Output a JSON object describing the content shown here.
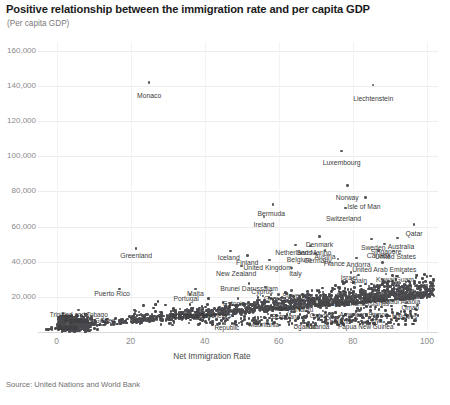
{
  "header": {
    "title": "Positive relationship between the immigration rate and per capita GDP",
    "subtitle": "(Per capita GDP)"
  },
  "footer": {
    "source": "Source: United Nations and World Bank"
  },
  "chart_data": {
    "type": "scatter",
    "title": "Positive relationship between the immigration rate and per capita GDP",
    "subtitle": "(Per capita GDP)",
    "xlabel": "Net Immigration Rate",
    "ylabel": "(Per capita GDP)",
    "xlim": [
      -5,
      103
    ],
    "ylim": [
      0,
      165000
    ],
    "xticks": [
      0,
      20,
      40,
      60,
      80,
      100
    ],
    "xtick_labels": [
      "0",
      "20",
      "40",
      "60",
      "80",
      "100"
    ],
    "yticks": [
      20000,
      40000,
      60000,
      80000,
      100000,
      120000,
      140000,
      160000
    ],
    "ytick_labels": [
      "20,000",
      "40,000",
      "60,000",
      "80,000",
      "100,000",
      "120,000",
      "140,000",
      "160,000"
    ],
    "grid": true,
    "legend": "none",
    "marker_color": "#58585c",
    "source": "Source: United Nations and World Bank",
    "labeled_points": [
      {
        "name": "Monaco",
        "x": 25.0,
        "y": 142000,
        "lx": 25.0,
        "ly": 134000
      },
      {
        "name": "Liechtenstein",
        "x": 85.5,
        "y": 140500,
        "lx": 85.5,
        "ly": 132500
      },
      {
        "name": "Luxembourg",
        "x": 77.0,
        "y": 103000,
        "lx": 77.0,
        "ly": 96000
      },
      {
        "name": "Norway",
        "x": 78.5,
        "y": 83500,
        "lx": 78.5,
        "ly": 76500
      },
      {
        "name": "Isle of Man",
        "x": 83.5,
        "y": 76500,
        "lx": 83.0,
        "ly": 71000
      },
      {
        "name": "Switzerland",
        "x": 78.0,
        "y": 70500,
        "lx": 77.5,
        "ly": 64500
      },
      {
        "name": "Bermuda",
        "x": 58.5,
        "y": 72500,
        "lx": 58.0,
        "ly": 67000
      },
      {
        "name": "Ireland",
        "x": 56.0,
        "y": 65500,
        "lx": 56.0,
        "ly": 61000
      },
      {
        "name": "Qatar",
        "x": 96.5,
        "y": 61000,
        "lx": 96.5,
        "ly": 55500
      },
      {
        "name": "Denmark",
        "x": 71.0,
        "y": 54500,
        "lx": 71.0,
        "ly": 49500
      },
      {
        "name": "Sweden",
        "x": 85.0,
        "y": 53000,
        "lx": 85.5,
        "ly": 48000
      },
      {
        "name": "Australia",
        "x": 92.0,
        "y": 53500,
        "lx": 93.0,
        "ly": 48500
      },
      {
        "name": "Singapore",
        "x": 88.5,
        "y": 50000,
        "lx": 89.0,
        "ly": 45500
      },
      {
        "name": "Canada",
        "x": 87.0,
        "y": 46500,
        "lx": 87.0,
        "ly": 43000
      },
      {
        "name": "United States",
        "x": 91.0,
        "y": 46000,
        "lx": 91.5,
        "ly": 42500
      },
      {
        "name": "Netherlands",
        "x": 64.5,
        "y": 49500,
        "lx": 64.0,
        "ly": 45000
      },
      {
        "name": "San Marino",
        "x": 68.5,
        "y": 49000,
        "lx": 69.5,
        "ly": 45000
      },
      {
        "name": "Austria",
        "x": 72.5,
        "y": 46500,
        "lx": 72.5,
        "ly": 42500
      },
      {
        "name": "Belgium",
        "x": 66.0,
        "y": 45000,
        "lx": 65.5,
        "ly": 41000
      },
      {
        "name": "Germany",
        "x": 70.0,
        "y": 44500,
        "lx": 70.5,
        "ly": 40500
      },
      {
        "name": "Andorra",
        "x": 81.0,
        "y": 42000,
        "lx": 81.5,
        "ly": 38000
      },
      {
        "name": "France",
        "x": 76.0,
        "y": 41500,
        "lx": 75.0,
        "ly": 38500
      },
      {
        "name": "Iceland",
        "x": 47.0,
        "y": 46000,
        "lx": 46.5,
        "ly": 42000
      },
      {
        "name": "Finland",
        "x": 51.5,
        "y": 43500,
        "lx": 51.5,
        "ly": 39500
      },
      {
        "name": "United Kingdom",
        "x": 57.5,
        "y": 41000,
        "lx": 57.0,
        "ly": 36500
      },
      {
        "name": "New Zealand",
        "x": 50.0,
        "y": 37500,
        "lx": 48.5,
        "ly": 33000
      },
      {
        "name": "Italy",
        "x": 63.5,
        "y": 36500,
        "lx": 64.5,
        "ly": 33000
      },
      {
        "name": "Greenland",
        "x": 21.5,
        "y": 47500,
        "lx": 21.5,
        "ly": 43500
      },
      {
        "name": "United Arab Emirates",
        "x": 88.0,
        "y": 39500,
        "lx": 88.5,
        "ly": 35500
      },
      {
        "name": "Israel",
        "x": 79.5,
        "y": 34000,
        "lx": 79.0,
        "ly": 30500
      },
      {
        "name": "Spain",
        "x": 81.5,
        "y": 32500,
        "lx": 81.5,
        "ly": 29000
      },
      {
        "name": "Kuwait",
        "x": 89.0,
        "y": 33000,
        "lx": 89.0,
        "ly": 29500
      },
      {
        "name": "Guam",
        "x": 93.5,
        "y": 33500,
        "lx": 94.0,
        "ly": 29500
      },
      {
        "name": "Puerto Rico",
        "x": 17.0,
        "y": 24500,
        "lx": 15.0,
        "ly": 21500
      },
      {
        "name": "Malta",
        "x": 37.5,
        "y": 24500,
        "lx": 37.5,
        "ly": 21500
      },
      {
        "name": "Portugal",
        "x": 36.0,
        "y": 21500,
        "lx": 35.0,
        "ly": 18500
      },
      {
        "name": "Brunei Darussalam",
        "x": 52.0,
        "y": 27500,
        "lx": 52.0,
        "ly": 24500
      },
      {
        "name": "Cyprus",
        "x": 56.5,
        "y": 25500,
        "lx": 55.5,
        "ly": 22500
      },
      {
        "name": "Slovenia",
        "x": 63.5,
        "y": 23500,
        "lx": 64.5,
        "ly": 20500
      },
      {
        "name": "Greece",
        "x": 60.0,
        "y": 21500,
        "lx": 59.0,
        "ly": 18500
      },
      {
        "name": "Aruba",
        "x": 67.5,
        "y": 21000,
        "lx": 68.5,
        "ly": 18500
      },
      {
        "name": "Estonia",
        "x": 49.0,
        "y": 19000,
        "lx": 48.0,
        "ly": 16000
      },
      {
        "name": "Turkey",
        "x": 59.5,
        "y": 15500,
        "lx": 60.5,
        "ly": 13000
      },
      {
        "name": "Northern Mariana Islands",
        "x": 80.0,
        "y": 19500,
        "lx": 79.5,
        "ly": 16000
      },
      {
        "name": "Bahrain",
        "x": 85.5,
        "y": 21000,
        "lx": 85.5,
        "ly": 18000
      },
      {
        "name": "Saudi Arabia",
        "x": 92.0,
        "y": 20000,
        "lx": 93.0,
        "ly": 17000
      },
      {
        "name": "Oman",
        "x": 94.5,
        "y": 16500,
        "lx": 95.5,
        "ly": 13500
      },
      {
        "name": "Gabon",
        "x": 72.0,
        "y": 12000,
        "lx": 71.0,
        "ly": 9000
      },
      {
        "name": "American Samoa",
        "x": 82.0,
        "y": 12500,
        "lx": 83.0,
        "ly": 9500
      },
      {
        "name": "Botswana",
        "x": 63.5,
        "y": 11500,
        "lx": 62.0,
        "ly": 8500
      },
      {
        "name": "Nauru",
        "x": 67.0,
        "y": 15000,
        "lx": 67.0,
        "ly": 12500
      },
      {
        "name": "Maldives",
        "x": 93.0,
        "y": 11500,
        "lx": 94.0,
        "ly": 8500
      },
      {
        "name": "Libya",
        "x": 86.0,
        "y": 8500,
        "lx": 86.0,
        "ly": 6000
      },
      {
        "name": "Thailand",
        "x": 76.0,
        "y": 8000,
        "lx": 76.0,
        "ly": 5500
      },
      {
        "name": "Papua New Guinea",
        "x": 83.0,
        "y": 5500,
        "lx": 83.5,
        "ly": 3000
      },
      {
        "name": "Mauritania",
        "x": 57.0,
        "y": 6500,
        "lx": 56.0,
        "ly": 4000
      },
      {
        "name": "Uganda",
        "x": 66.5,
        "y": 5500,
        "lx": 67.0,
        "ly": 3000
      },
      {
        "name": "Rwanda",
        "x": 70.0,
        "y": 5000,
        "lx": 70.5,
        "ly": 3000
      },
      {
        "name": "Trinidad and Tobago",
        "x": 6.0,
        "y": 12500,
        "lx": 6.0,
        "ly": 9500
      },
      {
        "name": "Equatorial Guinea",
        "x": 9.5,
        "y": 9000,
        "lx": 9.0,
        "ly": 6500
      },
      {
        "name": "Archipelago",
        "x": 35.0,
        "y": 11500,
        "lx": 35.5,
        "ly": 9000
      },
      {
        "name": "Seychelles",
        "x": 42.0,
        "y": 11000,
        "lx": 43.0,
        "ly": 9000
      },
      {
        "name": "Bosnia",
        "x": 3.0,
        "y": 5000,
        "lx": 3.0,
        "ly": 2500
      },
      {
        "name": "Republic",
        "x": 45.0,
        "y": 5000,
        "lx": 46.0,
        "ly": 2500
      }
    ]
  }
}
